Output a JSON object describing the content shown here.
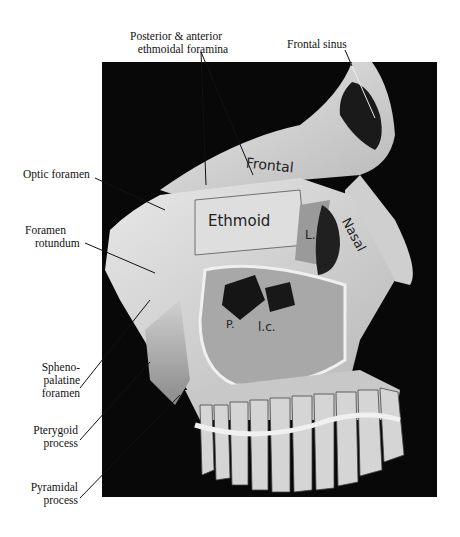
{
  "figure": {
    "panel_color": "#080808",
    "bone_color": "#d9d9d9"
  },
  "labels": {
    "posterior_anterior_ethmoidal": [
      "Posterior & anterior",
      "ethmoidal foramina"
    ],
    "frontal_sinus": "Frontal sinus",
    "optic_foramen": "Optic foramen",
    "foramen_rotundum": [
      "Foramen",
      "rotundum"
    ],
    "sphenopalatine_foramen": [
      "Spheno-",
      "palatine",
      "foramen"
    ],
    "pterygoid_process": [
      "Pterygoid",
      "process"
    ],
    "pyramidal_process": [
      "Pyramidal",
      "process"
    ]
  },
  "bone_labels": {
    "frontal": "Frontal",
    "ethmoid": "Ethmoid",
    "nasal": "Nasal",
    "lacrimal": "L.",
    "palatine": "P.",
    "lacrimal_canal": "l.c."
  }
}
